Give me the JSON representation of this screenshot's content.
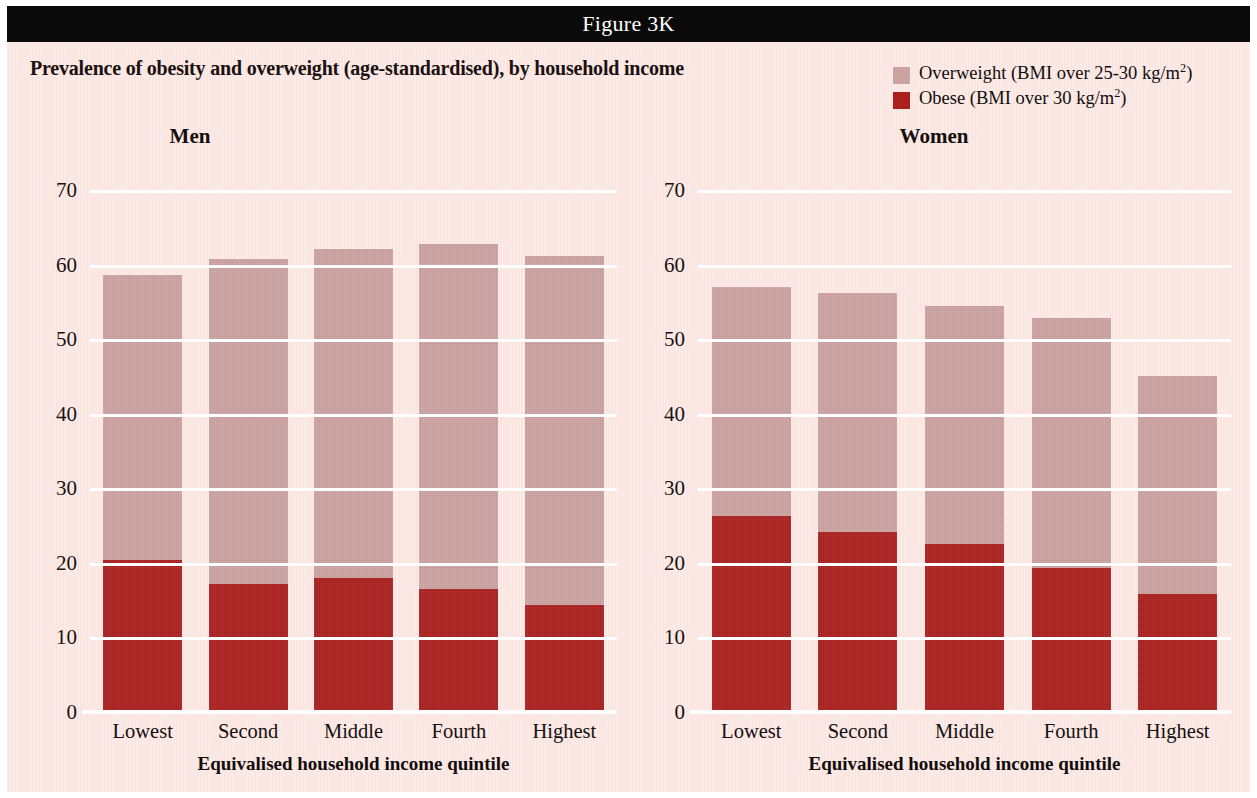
{
  "banner": {
    "title": "Figure 3K"
  },
  "subtitle": "Prevalence of obesity and overweight (age-standardised), by household income",
  "legend": {
    "items": [
      {
        "label_main": "Overweight (BMI over 25-30 kg/m",
        "sup": "2",
        "label_tail": ")",
        "color": "#cda3a2",
        "swatch_icon": "legend-swatch-overweight"
      },
      {
        "label_main": "Obese (BMI over 30 kg/m",
        "sup": "2",
        "label_tail": ")",
        "color": "#ab1f1d",
        "swatch_icon": "legend-swatch-obese"
      }
    ]
  },
  "panels": {
    "men": {
      "title": "Men",
      "ylabel": "Percent",
      "xtitle": "Equivalised household income quintile"
    },
    "women": {
      "title": "Women",
      "ylabel": "",
      "xtitle": "Equivalised household income quintile"
    }
  },
  "axis": {
    "yticks": [
      "70",
      "60",
      "50",
      "40",
      "30",
      "20",
      "10",
      "0"
    ],
    "ymin": 0,
    "ymax": 70
  },
  "colors": {
    "page_background": "#fae5e1",
    "banner_background": "#0b0a0a",
    "overweight": "#cda3a2",
    "obese": "#ab1f1d",
    "gridline": "#ffffff",
    "text": "#120d0c"
  },
  "chart_data": [
    {
      "type": "bar",
      "title": "Men",
      "subtitle": "Prevalence of obesity and overweight (age-standardised), by household income",
      "stacked": true,
      "xlabel": "Equivalised household income quintile",
      "ylabel": "Percent",
      "ylim": [
        0,
        70
      ],
      "yticks": [
        0,
        10,
        20,
        30,
        40,
        50,
        60,
        70
      ],
      "grid": true,
      "legend_position": "top-right",
      "categories": [
        "Lowest",
        "Second",
        "Middle",
        "Fourth",
        "Highest"
      ],
      "series": [
        {
          "name": "Obese (BMI over 30 kg/m2)",
          "color": "#ab1f1d",
          "values": [
            20.4,
            17.2,
            18.0,
            16.5,
            14.4
          ]
        },
        {
          "name": "Overweight (BMI over 25-30 kg/m2)",
          "color": "#cda3a2",
          "values": [
            38.2,
            43.6,
            44.1,
            46.2,
            46.8
          ]
        }
      ],
      "totals": [
        58.6,
        60.8,
        62.1,
        62.7,
        61.2
      ]
    },
    {
      "type": "bar",
      "title": "Women",
      "subtitle": "Prevalence of obesity and overweight (age-standardised), by household income",
      "stacked": true,
      "xlabel": "Equivalised household income quintile",
      "ylabel": "Percent",
      "ylim": [
        0,
        70
      ],
      "yticks": [
        0,
        10,
        20,
        30,
        40,
        50,
        60,
        70
      ],
      "grid": true,
      "legend_position": "top-right",
      "categories": [
        "Lowest",
        "Second",
        "Middle",
        "Fourth",
        "Highest"
      ],
      "series": [
        {
          "name": "Obese (BMI over 30 kg/m2)",
          "color": "#ab1f1d",
          "values": [
            26.3,
            24.2,
            22.5,
            19.3,
            15.8
          ]
        },
        {
          "name": "Overweight (BMI over 25-30 kg/m2)",
          "color": "#cda3a2",
          "values": [
            30.7,
            32.0,
            32.0,
            33.6,
            29.2
          ]
        }
      ],
      "totals": [
        57.0,
        56.2,
        54.5,
        52.9,
        45.0
      ]
    }
  ]
}
